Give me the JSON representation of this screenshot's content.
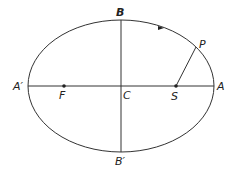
{
  "diagram": {
    "labels": {
      "B": "B",
      "B_prime": "B′",
      "A": "A",
      "A_prime": "A′",
      "C": "C",
      "F": "F",
      "S": "S",
      "P": "P"
    },
    "colors": {
      "stroke": "#333333",
      "text": "#222222"
    }
  }
}
